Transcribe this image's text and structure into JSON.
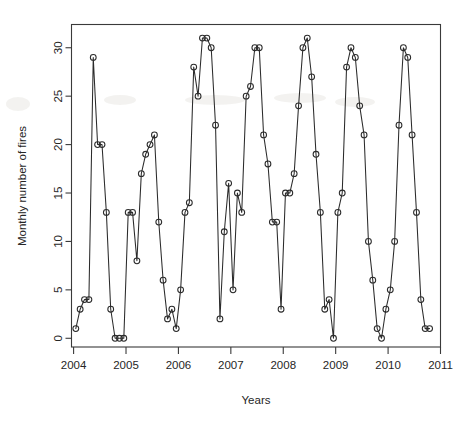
{
  "chart_data": {
    "type": "line",
    "title": "",
    "subtitle": "",
    "xlabel": "Years",
    "ylabel": "Monthly number of fires",
    "xlim": [
      2003.96,
      2011.0
    ],
    "ylim": [
      -0.9,
      32.4
    ],
    "grid": false,
    "legend": null,
    "marker": "open-circle",
    "x_tick_labels": [
      "2004",
      "2005",
      "2006",
      "2007",
      "2008",
      "2009",
      "2010",
      "2011"
    ],
    "x_tick_values": [
      2004,
      2005,
      2006,
      2007,
      2008,
      2009,
      2010,
      2011
    ],
    "y_tick_labels": [
      "0",
      "5",
      "10",
      "15",
      "20",
      "25",
      "30"
    ],
    "y_tick_values": [
      0,
      5,
      10,
      15,
      20,
      25,
      30
    ],
    "series": [
      {
        "name": "Monthly number of fires",
        "x": [
          2004.042,
          2004.125,
          2004.208,
          2004.292,
          2004.375,
          2004.458,
          2004.542,
          2004.625,
          2004.708,
          2004.792,
          2004.875,
          2004.958,
          2005.042,
          2005.125,
          2005.208,
          2005.292,
          2005.375,
          2005.458,
          2005.542,
          2005.625,
          2005.708,
          2005.792,
          2005.875,
          2005.958,
          2006.042,
          2006.125,
          2006.208,
          2006.292,
          2006.375,
          2006.458,
          2006.542,
          2006.625,
          2006.708,
          2006.792,
          2006.875,
          2006.958,
          2007.042,
          2007.125,
          2007.208,
          2007.292,
          2007.375,
          2007.458,
          2007.542,
          2007.625,
          2007.708,
          2007.792,
          2007.875,
          2007.958,
          2008.042,
          2008.125,
          2008.208,
          2008.292,
          2008.375,
          2008.458,
          2008.542,
          2008.625,
          2008.708,
          2008.792,
          2008.875,
          2008.958,
          2009.042,
          2009.125,
          2009.208,
          2009.292,
          2009.375,
          2009.458,
          2009.542,
          2009.625,
          2009.708,
          2009.792,
          2009.875,
          2009.958,
          2010.042,
          2010.125,
          2010.208,
          2010.292,
          2010.375,
          2010.458,
          2010.542,
          2010.625,
          2010.708,
          2010.792
        ],
        "values": [
          1,
          3,
          4,
          4,
          29,
          20,
          20,
          13,
          3,
          0,
          0,
          0,
          13,
          13,
          8,
          17,
          19,
          20,
          21,
          12,
          6,
          2,
          3,
          1,
          5,
          13,
          14,
          28,
          25,
          31,
          31,
          30,
          22,
          2,
          11,
          16,
          5,
          15,
          13,
          25,
          26,
          30,
          30,
          21,
          18,
          12,
          12,
          3,
          15,
          15,
          17,
          24,
          30,
          31,
          27,
          19,
          13,
          3,
          4,
          0,
          13,
          15,
          28,
          30,
          29,
          24,
          21,
          10,
          6,
          1,
          0,
          3,
          5,
          10,
          22,
          30,
          29,
          21,
          13,
          4,
          1,
          1
        ]
      }
    ]
  }
}
